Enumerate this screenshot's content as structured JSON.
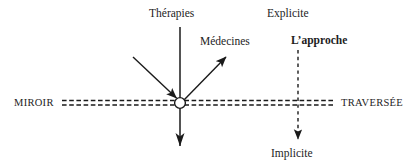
{
  "diagram": {
    "title_hidden": "",
    "labels": {
      "therapies": "Thérapies",
      "medecines": "Médecines",
      "explicite": "Explicite",
      "approche": "L’approche",
      "miroir": "MIROIR",
      "traversee": "TRAVERSÉE",
      "implicite": "Implicite"
    },
    "colors": {
      "ink": "#1a1a1a",
      "background": "#ffffff"
    },
    "elements": {
      "mirror_axis": "double-dashed-horizontal-line",
      "node": "circle-junction",
      "incoming_arrow": "diagonal-arrow-down-right",
      "outgoing_arrow": "diagonal-arrow-up-right",
      "vertical_solid_arrow": "arrow-down",
      "vertical_dashed_arrow": "dashed-arrow-down"
    }
  }
}
